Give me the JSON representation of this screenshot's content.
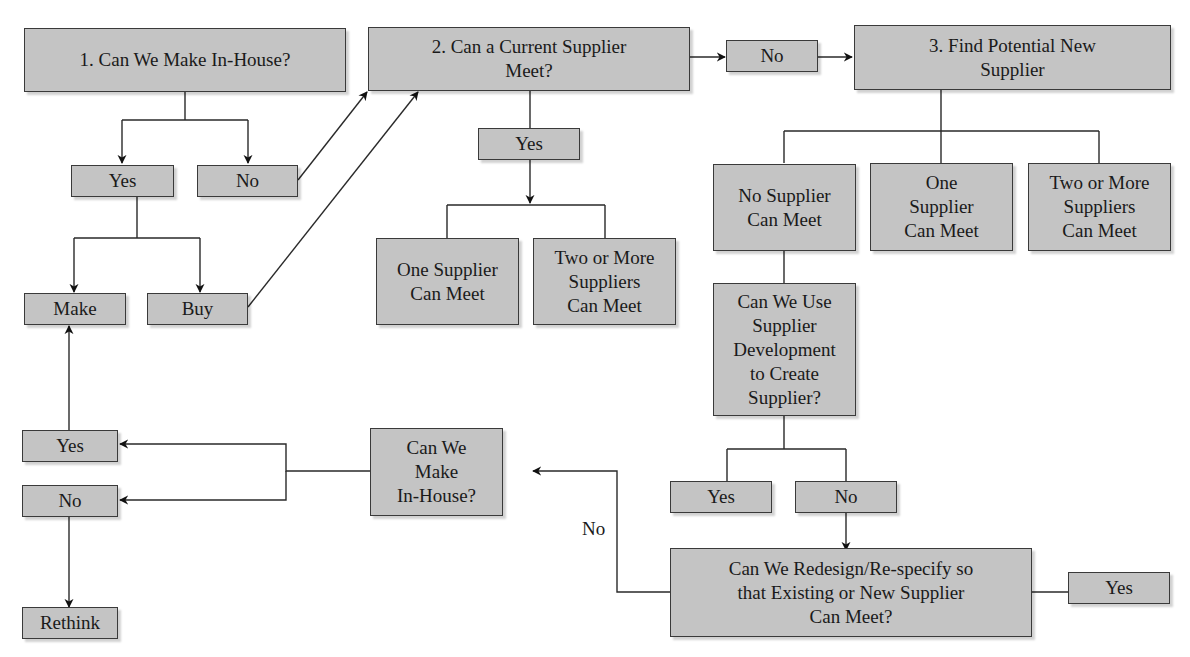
{
  "diagram": {
    "nodes": {
      "q1": "1. Can We Make In-House?",
      "q1_yes": "Yes",
      "q1_no": "No",
      "make": "Make",
      "buy": "Buy",
      "q2": "2. Can a Current Supplier\nMeet?",
      "q2_no": "No",
      "q2_yes": "Yes",
      "q2_one": "One Supplier\nCan Meet",
      "q2_two": "Two or More\nSuppliers\nCan Meet",
      "q3": "3. Find Potential New\nSupplier",
      "q3_none": "No Supplier\nCan Meet",
      "q3_one": "One\nSupplier\nCan Meet",
      "q3_two": "Two or More\nSuppliers\nCan Meet",
      "q_dev": "Can We Use\nSupplier\nDevelopment\nto Create\nSupplier?",
      "dev_yes": "Yes",
      "dev_no": "No",
      "q_redesign": "Can We Redesign/Re-specify so\nthat Existing or New Supplier\nCan Meet?",
      "redesign_yes": "Yes",
      "q_inhouse2": "Can We\nMake\nIn-House?",
      "inhouse2_yes": "Yes",
      "inhouse2_no": "No",
      "rethink": "Rethink"
    },
    "edge_labels": {
      "redesign_no": "No"
    },
    "colors": {
      "box_fill": "#c4c4c4",
      "box_border": "#3a3a3a",
      "line": "#2a2a2a"
    }
  }
}
